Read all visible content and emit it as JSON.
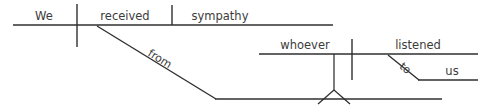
{
  "diagram": {
    "type": "reed-kellogg-sentence-diagram",
    "sentence": "We received sympathy from whoever listened to us",
    "ink_color": "#2f2f2f",
    "text_color": "#3b3b3b",
    "background_color": "#ffffff",
    "main_clause": {
      "subject": "We",
      "verb": "received",
      "direct_object": "sympathy"
    },
    "preposition": {
      "word": "from",
      "orientation": "diagonal-rotated"
    },
    "subordinate_clause": {
      "subject": "whoever",
      "verb": "listened",
      "preposition": "to",
      "object_of_preposition": "us"
    }
  }
}
